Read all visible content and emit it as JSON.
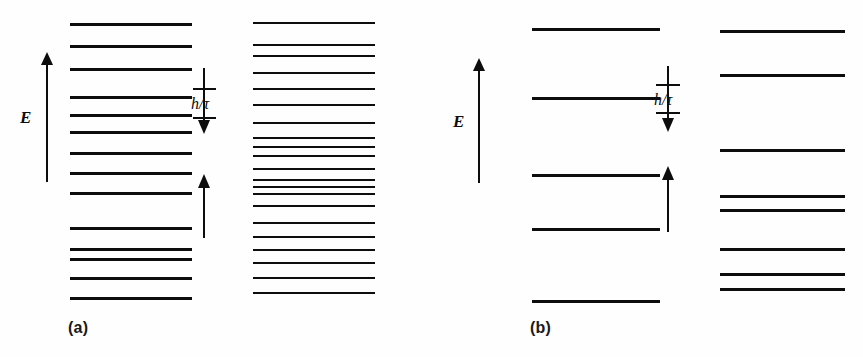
{
  "figure": {
    "background": "#fefefe",
    "ink": "#0d0d0d",
    "width": 863,
    "height": 357
  },
  "panels": [
    {
      "id": "a",
      "caption": "(a)",
      "axis": {
        "label": "E",
        "name": "energy-axis",
        "direction": "up"
      },
      "gap_annotation": {
        "label": "h/τ",
        "plain": "h/tau",
        "meaning": "lifetime energy broadening"
      },
      "columns": [
        {
          "name": "left",
          "count": 14,
          "levels_y": [
            23,
            45,
            68,
            96,
            114,
            131,
            152,
            172,
            192,
            227,
            248,
            258,
            277,
            297
          ]
        },
        {
          "name": "right",
          "count": 21,
          "levels_y": [
            22,
            44,
            55,
            72,
            88,
            104,
            122,
            137,
            146,
            155,
            168,
            179,
            186,
            193,
            205,
            222,
            236,
            249,
            262,
            277,
            292
          ]
        }
      ]
    },
    {
      "id": "b",
      "caption": "(b)",
      "axis": {
        "label": "E",
        "name": "energy-axis",
        "direction": "up"
      },
      "gap_annotation": {
        "label": "h/τ",
        "plain": "h/tau",
        "meaning": "lifetime energy broadening"
      },
      "columns": [
        {
          "name": "left",
          "count": 5,
          "levels_y": [
            28,
            97,
            174,
            228,
            300
          ]
        },
        {
          "name": "right",
          "count": 8,
          "levels_y": [
            30,
            74,
            149,
            195,
            209,
            248,
            273,
            288
          ]
        }
      ]
    }
  ],
  "chart_data": {
    "type": "line",
    "title": "",
    "xlabel": "",
    "ylabel": "E",
    "grid": false,
    "legend": null,
    "annotations": [
      "h/τ",
      "h/τ",
      "(a)",
      "(b)",
      "E",
      "E"
    ],
    "series": [
      {
        "name": "panel-a-left-levels",
        "values": [
          23,
          45,
          68,
          96,
          114,
          131,
          152,
          172,
          192,
          227,
          248,
          258,
          277,
          297
        ]
      },
      {
        "name": "panel-a-right-levels",
        "values": [
          22,
          44,
          55,
          72,
          88,
          104,
          122,
          137,
          146,
          155,
          168,
          179,
          186,
          193,
          205,
          222,
          236,
          249,
          262,
          277,
          292
        ]
      },
      {
        "name": "panel-b-left-levels",
        "values": [
          28,
          97,
          174,
          228,
          300
        ]
      },
      {
        "name": "panel-b-right-levels",
        "values": [
          30,
          74,
          149,
          195,
          209,
          248,
          273,
          288
        ]
      }
    ]
  }
}
